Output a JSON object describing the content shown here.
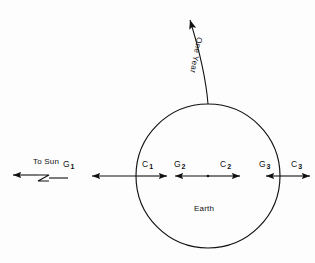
{
  "figure": {
    "body_label": "Earth",
    "sun_direction_label": "To Sun",
    "orbit_label": "One Year",
    "stroke_color": "#111111",
    "background_color": "#fdfdfd",
    "vectors": [
      {
        "id": "g1",
        "label": "G",
        "subscript": "1",
        "direction": "left",
        "meaning": "gravitational-force-near-side"
      },
      {
        "id": "c1",
        "label": "C",
        "subscript": "1",
        "direction": "right",
        "meaning": "centrifugal-force-near-side"
      },
      {
        "id": "g2",
        "label": "G",
        "subscript": "2",
        "direction": "left",
        "meaning": "gravitational-force-center"
      },
      {
        "id": "c2",
        "label": "C",
        "subscript": "2",
        "direction": "right",
        "meaning": "centrifugal-force-center"
      },
      {
        "id": "g3",
        "label": "G",
        "subscript": "3",
        "direction": "left",
        "meaning": "gravitational-force-far-side"
      },
      {
        "id": "c3",
        "label": "C",
        "subscript": "3",
        "direction": "right",
        "meaning": "centrifugal-force-far-side"
      }
    ],
    "geometry": {
      "circle_center_x": 208,
      "circle_center_y": 176,
      "circle_radius": 72,
      "force_axis_y": 176
    }
  }
}
